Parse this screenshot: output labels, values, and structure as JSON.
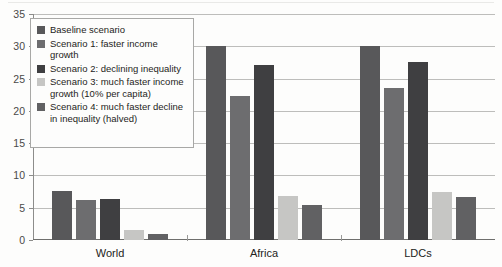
{
  "chart_data": {
    "type": "bar",
    "title": "",
    "subtitle": "",
    "xlabel": "",
    "ylabel": "",
    "categories": [
      "World",
      "Africa",
      "LDCs"
    ],
    "ylim": [
      0,
      35
    ],
    "yticks": [
      0,
      5,
      10,
      15,
      20,
      25,
      30,
      35
    ],
    "ytick_labels": [
      "0",
      "5",
      "10",
      "15",
      "20",
      "25",
      "30",
      "35"
    ],
    "grid": true,
    "legend_position": "upper-left-inside",
    "series": [
      {
        "name": "Baseline scenario",
        "color": "#58585a",
        "values": [
          7.6,
          30.0,
          30.0
        ]
      },
      {
        "name": "Scenario 1: faster income growth",
        "color": "#6d6d6f",
        "values": [
          6.2,
          22.3,
          23.6
        ]
      },
      {
        "name": "Scenario 2: declining inequality",
        "color": "#3f3f41",
        "values": [
          6.4,
          27.1,
          27.6
        ]
      },
      {
        "name": "Scenario 3: much faster income growth (10% per capita)",
        "color": "#c6c6c4",
        "values": [
          1.5,
          6.8,
          7.5
        ]
      },
      {
        "name": "Scenario 4: much faster decline in inequality (halved)",
        "color": "#616163",
        "values": [
          1.0,
          5.4,
          6.6
        ]
      }
    ]
  },
  "legend": {
    "items": [
      {
        "label": "Baseline scenario"
      },
      {
        "label": "Scenario 1: faster income growth"
      },
      {
        "label": "Scenario 2: declining inequality"
      },
      {
        "label": "Scenario 3: much faster income growth (10% per capita)"
      },
      {
        "label": "Scenario 4: much faster decline in inequality (halved)"
      }
    ]
  }
}
